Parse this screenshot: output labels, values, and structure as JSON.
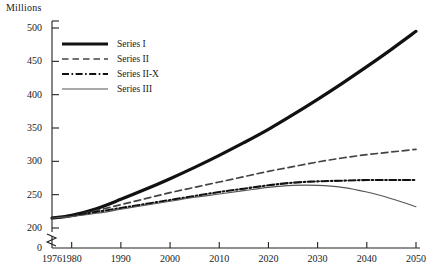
{
  "chart_data": {
    "type": "line",
    "title": "",
    "ylabel": "Millions",
    "xlabel": "",
    "ylim": [
      200,
      500
    ],
    "yticks": [
      0,
      200,
      250,
      300,
      350,
      400,
      450,
      500
    ],
    "ytick_labels": [
      "0",
      "200",
      "250",
      "300",
      "350",
      "400",
      "450",
      "500"
    ],
    "axis_break": true,
    "axis_break_between": [
      0,
      200
    ],
    "grid": false,
    "legend_position": "upper-left-inside",
    "xticks": [
      1976,
      1980,
      1990,
      2000,
      2010,
      2020,
      2030,
      2040,
      2050
    ],
    "xtick_labels": [
      "1976",
      "1980",
      "1990",
      "2000",
      "2010",
      "2020",
      "2030",
      "2040",
      "2050"
    ],
    "xlim": [
      1976,
      2050
    ],
    "x": [
      1976,
      1980,
      1985,
      1990,
      1995,
      2000,
      2005,
      2010,
      2015,
      2020,
      2025,
      2030,
      2035,
      2040,
      2045,
      2050
    ],
    "series": [
      {
        "name": "Series I",
        "style": "solid-thick",
        "color": "#111111",
        "values": [
          215,
          219,
          229,
          243,
          258,
          274,
          291,
          309,
          328,
          348,
          370,
          393,
          417,
          442,
          468,
          495
        ]
      },
      {
        "name": "Series II",
        "style": "dashed",
        "color": "#444444",
        "values": [
          215,
          218,
          226,
          235,
          244,
          253,
          261,
          269,
          277,
          285,
          292,
          299,
          305,
          310,
          314,
          318
        ]
      },
      {
        "name": "Series II-X",
        "style": "dash-dot",
        "color": "#111111",
        "values": [
          215,
          218,
          224,
          230,
          236,
          242,
          248,
          254,
          259,
          264,
          268,
          270,
          271,
          272,
          272,
          272
        ]
      },
      {
        "name": "Series III",
        "style": "solid-thin",
        "color": "#555555",
        "values": [
          215,
          217,
          222,
          228,
          234,
          240,
          246,
          251,
          256,
          261,
          264,
          264,
          261,
          254,
          244,
          232
        ]
      }
    ]
  },
  "legend": {
    "items": [
      {
        "label": "Series I"
      },
      {
        "label": "Series II"
      },
      {
        "label": "Series II-X"
      },
      {
        "label": "Series III"
      }
    ]
  }
}
